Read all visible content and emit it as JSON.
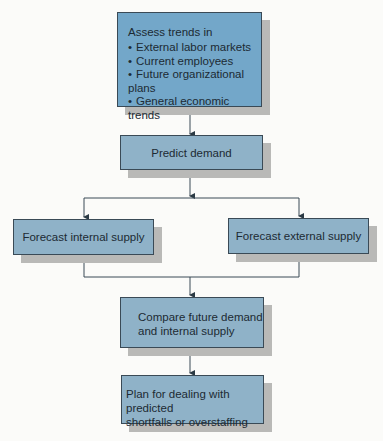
{
  "diagram": {
    "type": "flowchart",
    "nodes": {
      "assess": {
        "title": "Assess trends in",
        "items": [
          "External labor markets",
          "Current employees",
          "Future organizational plans",
          "General economic trends"
        ]
      },
      "predict": {
        "label": "Predict demand"
      },
      "internal": {
        "label": "Forecast internal supply"
      },
      "external": {
        "label": "Forecast external supply"
      },
      "compare": {
        "line1": "Compare future demand",
        "line2": "and internal supply"
      },
      "plan": {
        "line1": "Plan for dealing with predicted",
        "line2": "shortfalls or overstaffing"
      }
    },
    "edges": [
      [
        "assess",
        "predict"
      ],
      [
        "predict",
        "internal"
      ],
      [
        "predict",
        "external"
      ],
      [
        "internal",
        "compare"
      ],
      [
        "external",
        "compare"
      ],
      [
        "compare",
        "plan"
      ]
    ],
    "colors": {
      "box_dark": "#73a7c9",
      "box_light": "#8fb2c8",
      "shadow": "#b9b9b7",
      "line": "#3a4a56"
    }
  }
}
